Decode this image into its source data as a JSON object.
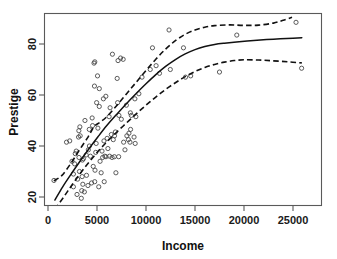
{
  "chart_data": {
    "type": "scatter",
    "title": "",
    "xlabel": "Income",
    "ylabel": "Prestige",
    "xlim": [
      0,
      26500
    ],
    "ylim": [
      13,
      90
    ],
    "grid": false,
    "legend": null,
    "xticks": [
      0,
      5000,
      10000,
      15000,
      20000,
      25000
    ],
    "xtick_labels": [
      "0",
      "5000",
      "10000",
      "15000",
      "20000",
      "25000"
    ],
    "yticks": [
      20,
      40,
      60,
      80
    ],
    "ytick_labels": [
      "20",
      "40",
      "60",
      "80"
    ],
    "marker": "open-circle",
    "marker_color": "#4a4a4a",
    "fit_color": "#111111",
    "band_style": "dashed",
    "points": [
      [
        611,
        26.5
      ],
      [
        1656,
        15.3
      ],
      [
        1890,
        41.5
      ],
      [
        2216,
        42.0
      ],
      [
        2448,
        34.0
      ],
      [
        2594,
        29.0
      ],
      [
        2594,
        24.0
      ],
      [
        2716,
        33.0
      ],
      [
        2783,
        37.0
      ],
      [
        2880,
        38.0
      ],
      [
        2960,
        21.0
      ],
      [
        3021,
        27.0
      ],
      [
        3116,
        43.5
      ],
      [
        3148,
        46.0
      ],
      [
        3161,
        35.5
      ],
      [
        3211,
        30.0
      ],
      [
        3250,
        47.5
      ],
      [
        3283,
        44.0
      ],
      [
        3400,
        19.5
      ],
      [
        3446,
        22.5
      ],
      [
        3485,
        28.0
      ],
      [
        3511,
        34.5
      ],
      [
        3553,
        25.0
      ],
      [
        3617,
        35.0
      ],
      [
        3711,
        22.0
      ],
      [
        3770,
        50.0
      ],
      [
        3897,
        36.5
      ],
      [
        3930,
        28.5
      ],
      [
        4075,
        24.5
      ],
      [
        4116,
        38.5
      ],
      [
        4210,
        46.5
      ],
      [
        4224,
        40.0
      ],
      [
        4330,
        36.0
      ],
      [
        4444,
        25.5
      ],
      [
        4504,
        51.0
      ],
      [
        4549,
        48.0
      ],
      [
        4614,
        32.0
      ],
      [
        4696,
        72.5
      ],
      [
        4741,
        63.5
      ],
      [
        4767,
        26.0
      ],
      [
        4772,
        73.0
      ],
      [
        4798,
        30.5
      ],
      [
        4871,
        37.5
      ],
      [
        4914,
        41.0
      ],
      [
        4961,
        57.0
      ],
      [
        5052,
        67.5
      ],
      [
        5092,
        47.0
      ],
      [
        5180,
        24.0
      ],
      [
        5234,
        55.5
      ],
      [
        5234,
        62.5
      ],
      [
        5313,
        34.0
      ],
      [
        5425,
        29.5
      ],
      [
        5511,
        38.0
      ],
      [
        5576,
        35.5
      ],
      [
        5654,
        58.5
      ],
      [
        5710,
        42.0
      ],
      [
        5735,
        26.0
      ],
      [
        5795,
        36.0
      ],
      [
        5902,
        59.5
      ],
      [
        5913,
        35.8
      ],
      [
        6035,
        43.0
      ],
      [
        6112,
        39.0
      ],
      [
        6235,
        51.5
      ],
      [
        6285,
        36.0
      ],
      [
        6336,
        55.0
      ],
      [
        6462,
        44.5
      ],
      [
        6538,
        35.5
      ],
      [
        6573,
        76.0
      ],
      [
        6662,
        42.5
      ],
      [
        6771,
        35.8
      ],
      [
        6788,
        44.0
      ],
      [
        6873,
        45.5
      ],
      [
        6929,
        29.5
      ],
      [
        7059,
        66.5
      ],
      [
        7101,
        57.0
      ],
      [
        7147,
        73.5
      ],
      [
        7210,
        35.8
      ],
      [
        7234,
        52.0
      ],
      [
        7405,
        74.5
      ],
      [
        7482,
        50.5
      ],
      [
        7668,
        74.0
      ],
      [
        7716,
        41.5
      ],
      [
        7853,
        38.5
      ],
      [
        7998,
        56.0
      ],
      [
        8049,
        44.0
      ],
      [
        8206,
        42.5
      ],
      [
        8258,
        45.0
      ],
      [
        8363,
        41.5
      ],
      [
        8403,
        53.0
      ],
      [
        8425,
        46.5
      ],
      [
        8501,
        52.0
      ],
      [
        8780,
        43.5
      ],
      [
        8865,
        58.5
      ],
      [
        8895,
        41.0
      ],
      [
        8965,
        51.5
      ],
      [
        9271,
        60.5
      ],
      [
        9593,
        67.0
      ],
      [
        10432,
        70.0
      ],
      [
        10660,
        78.5
      ],
      [
        11030,
        71.5
      ],
      [
        11377,
        68.5
      ],
      [
        12351,
        85.5
      ],
      [
        12480,
        70.0
      ],
      [
        13823,
        78.5
      ],
      [
        14032,
        67.0
      ],
      [
        14558,
        67.5
      ],
      [
        17498,
        69.0
      ],
      [
        19263,
        83.5
      ],
      [
        25308,
        88.5
      ],
      [
        25879,
        70.5
      ]
    ],
    "fit_curve": [
      [
        700,
        18.8
      ],
      [
        1500,
        24.0
      ],
      [
        2400,
        29.2
      ],
      [
        3300,
        34.2
      ],
      [
        4200,
        39.0
      ],
      [
        5100,
        43.6
      ],
      [
        6000,
        48.0
      ],
      [
        7000,
        52.4
      ],
      [
        8000,
        56.6
      ],
      [
        9000,
        60.6
      ],
      [
        10000,
        64.4
      ],
      [
        11000,
        68.0
      ],
      [
        12000,
        71.2
      ],
      [
        13000,
        73.9
      ],
      [
        14000,
        76.1
      ],
      [
        15000,
        77.8
      ],
      [
        16000,
        79.0
      ],
      [
        17000,
        79.8
      ],
      [
        18000,
        80.3
      ],
      [
        19500,
        80.9
      ],
      [
        21000,
        81.4
      ],
      [
        23000,
        81.9
      ],
      [
        25000,
        82.3
      ],
      [
        25900,
        82.5
      ]
    ],
    "upper_band": [
      [
        600,
        26.3
      ],
      [
        1400,
        28.4
      ],
      [
        2300,
        33.0
      ],
      [
        3200,
        38.4
      ],
      [
        4100,
        43.6
      ],
      [
        4700,
        47.6
      ],
      [
        5300,
        49.3
      ],
      [
        6000,
        51.5
      ],
      [
        7000,
        55.8
      ],
      [
        8000,
        60.4
      ],
      [
        9000,
        65.0
      ],
      [
        10000,
        69.6
      ],
      [
        11000,
        74.0
      ],
      [
        12000,
        78.0
      ],
      [
        13000,
        81.3
      ],
      [
        14000,
        83.8
      ],
      [
        15000,
        85.5
      ],
      [
        16000,
        86.6
      ],
      [
        17000,
        87.2
      ],
      [
        18500,
        87.5
      ],
      [
        20000,
        87.3
      ],
      [
        21500,
        87.4
      ],
      [
        23000,
        88.2
      ],
      [
        24000,
        89.3
      ],
      [
        24900,
        90.5
      ]
    ],
    "lower_band": [
      [
        700,
        15.2
      ],
      [
        1600,
        20.0
      ],
      [
        2500,
        25.0
      ],
      [
        3400,
        29.8
      ],
      [
        4300,
        34.2
      ],
      [
        5200,
        38.3
      ],
      [
        6000,
        41.6
      ],
      [
        7000,
        45.4
      ],
      [
        8000,
        49.0
      ],
      [
        9000,
        52.6
      ],
      [
        10000,
        56.0
      ],
      [
        11000,
        59.2
      ],
      [
        12000,
        62.2
      ],
      [
        13000,
        64.8
      ],
      [
        14000,
        67.2
      ],
      [
        15000,
        69.2
      ],
      [
        16000,
        70.8
      ],
      [
        17000,
        72.0
      ],
      [
        18000,
        72.9
      ],
      [
        19000,
        73.5
      ],
      [
        20000,
        73.8
      ],
      [
        21500,
        73.7
      ],
      [
        23000,
        73.4
      ],
      [
        24500,
        73.0
      ],
      [
        25900,
        72.6
      ]
    ]
  }
}
